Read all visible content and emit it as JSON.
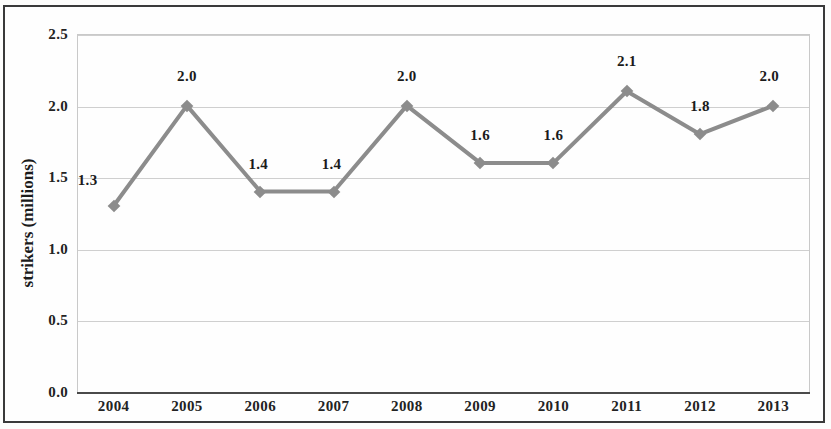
{
  "chart_data": {
    "type": "line",
    "title": "",
    "xlabel": "",
    "ylabel": "strikers (millions)",
    "categories": [
      "2004",
      "2005",
      "2006",
      "2007",
      "2008",
      "2009",
      "2010",
      "2011",
      "2012",
      "2013"
    ],
    "values": [
      1.3,
      2.0,
      1.4,
      1.4,
      2.0,
      1.6,
      1.6,
      2.1,
      1.8,
      2.0
    ],
    "point_labels": [
      "1.3",
      "2.0",
      "1.4",
      "1.4",
      "2.0",
      "1.6",
      "1.6",
      "2.1",
      "1.8",
      "2.0"
    ],
    "ylim": [
      0.0,
      2.5
    ],
    "yticks": [
      2.5,
      2.0,
      1.5,
      1.0,
      0.5,
      0.0
    ],
    "ytick_labels": [
      "2.5",
      "2.0",
      "1.5",
      "1.0",
      "0.5",
      "0.0"
    ],
    "grid": true,
    "legend": null,
    "series_color": "#8c8c8c",
    "marker": "diamond",
    "gridline_color": "#cfcfcf",
    "axis_color": "#4a4a4a",
    "text_color": "#1b1b1b"
  }
}
